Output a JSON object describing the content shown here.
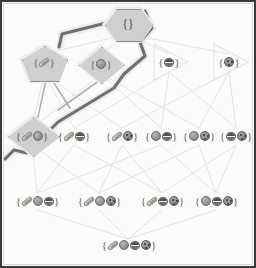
{
  "diagram": {
    "colors": {
      "frame": "#3a3a3a",
      "faint_edge": "#e2e2e2",
      "mid_edge": "#a9a9a9",
      "highlight_path": "#6e6e6e",
      "shape_fill": "#cfcfcf",
      "shape_stroke": "#8f8f8f",
      "text": "#4a4a4a"
    },
    "item_icons": [
      "hotdog-icon",
      "ball-icon",
      "bowl-icon",
      "cookie-icon"
    ],
    "brace_open": "{",
    "brace_close": "}",
    "nodes": [
      {
        "id": "empty",
        "label": "{}",
        "items": [],
        "shape": "hexagon",
        "highlighted": true,
        "x": 128,
        "y": 24
      },
      {
        "id": "h",
        "label": "{hotdog}",
        "items": [
          "hotdog"
        ],
        "shape": "pentagon",
        "highlighted": true,
        "x": 44,
        "y": 62
      },
      {
        "id": "b",
        "label": "{ball}",
        "items": [
          "ball"
        ],
        "shape": "diamond",
        "highlighted": true,
        "x": 101,
        "y": 64
      },
      {
        "id": "w",
        "label": "{bowl}",
        "items": [
          "bowl"
        ],
        "shape": "triangle",
        "highlighted": false,
        "x": 169,
        "y": 62
      },
      {
        "id": "c",
        "label": "{cookie}",
        "items": [
          "cookie"
        ],
        "shape": "triangle",
        "highlighted": false,
        "x": 229,
        "y": 62
      },
      {
        "id": "hb",
        "label": "{hotdog,ball}",
        "items": [
          "hotdog",
          "ball"
        ],
        "shape": "diamond",
        "highlighted": true,
        "x": 32,
        "y": 136
      },
      {
        "id": "hw",
        "label": "{hotdog,bowl}",
        "items": [
          "hotdog",
          "bowl"
        ],
        "shape": "none",
        "highlighted": false,
        "x": 74,
        "y": 136
      },
      {
        "id": "hc",
        "label": "{hotdog,cookie}",
        "items": [
          "hotdog",
          "cookie"
        ],
        "shape": "none",
        "highlighted": false,
        "x": 122,
        "y": 136
      },
      {
        "id": "bw",
        "label": "{ball,bowl}",
        "items": [
          "ball",
          "bowl"
        ],
        "shape": "none",
        "highlighted": false,
        "x": 161,
        "y": 136
      },
      {
        "id": "bc",
        "label": "{ball,cookie}",
        "items": [
          "ball",
          "cookie"
        ],
        "shape": "none",
        "highlighted": false,
        "x": 199,
        "y": 136
      },
      {
        "id": "wc",
        "label": "{bowl,cookie}",
        "items": [
          "bowl",
          "cookie"
        ],
        "shape": "none",
        "highlighted": false,
        "x": 236,
        "y": 136
      },
      {
        "id": "hbw",
        "label": "{hotdog,ball,bowl}",
        "items": [
          "hotdog",
          "ball",
          "bowl"
        ],
        "shape": "none",
        "highlighted": false,
        "x": 37,
        "y": 201
      },
      {
        "id": "hbc",
        "label": "{hotdog,ball,cookie}",
        "items": [
          "hotdog",
          "ball",
          "cookie"
        ],
        "shape": "none",
        "highlighted": false,
        "x": 99,
        "y": 201
      },
      {
        "id": "hwc",
        "label": "{hotdog,bowl,cookie}",
        "items": [
          "hotdog",
          "bowl",
          "cookie"
        ],
        "shape": "none",
        "highlighted": false,
        "x": 162,
        "y": 201
      },
      {
        "id": "bwc",
        "label": "{ball,bowl,cookie}",
        "items": [
          "ball",
          "bowl",
          "cookie"
        ],
        "shape": "none",
        "highlighted": false,
        "x": 216,
        "y": 201
      },
      {
        "id": "all",
        "label": "{hotdog,ball,bowl,cookie}",
        "items": [
          "hotdog",
          "ball",
          "bowl",
          "cookie"
        ],
        "shape": "none",
        "highlighted": false,
        "x": 128,
        "y": 245
      }
    ],
    "highlighted_path": [
      "empty",
      "h",
      "hb"
    ],
    "edge_count": 32
  }
}
